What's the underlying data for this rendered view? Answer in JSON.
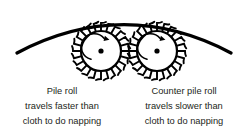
{
  "figure": {
    "background_color": "#ffffff",
    "line_color": "#000000",
    "text_color": "#231f20"
  },
  "cloth": {
    "name": "cloth-arc",
    "description": "curved cloth passing over the rolls",
    "stroke_width": 3.2,
    "start_x": 17,
    "start_y": 53,
    "end_x": 231,
    "end_y": 53,
    "peak_x": 124,
    "peak_y": 12
  },
  "rolls": [
    {
      "id": "pile-roll",
      "label": "Pile roll",
      "center_x": 101,
      "center_y": 51,
      "body_radius": 20,
      "hub_radius": 2.6,
      "tooth_count": 24,
      "tooth_length": 8,
      "rotation": "clockwise",
      "arrow_radius": 13
    },
    {
      "id": "counter-pile-roll",
      "label": "Counter pile roll",
      "center_x": 157,
      "center_y": 51,
      "body_radius": 20,
      "hub_radius": 2.6,
      "tooth_count": 24,
      "tooth_length": 8,
      "rotation": "clockwise",
      "arrow_radius": 13
    }
  ],
  "captions": {
    "left": {
      "center_x": 62,
      "line1": "Pile roll",
      "line2": "travels faster than",
      "line3": "cloth to do napping",
      "line1_y": 94,
      "line2_y": 109,
      "line3_y": 124
    },
    "right": {
      "center_x": 184,
      "line1": "Counter pile roll",
      "line2": "travels slower than",
      "line3": "cloth to do napping",
      "line1_y": 94,
      "line2_y": 109,
      "line3_y": 124
    }
  }
}
